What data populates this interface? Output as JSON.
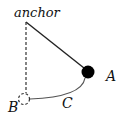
{
  "diagram": {
    "labels": {
      "anchor": "anchor",
      "a": "A",
      "b": "B",
      "c": "C"
    },
    "colors": {
      "line": "#222222",
      "ball": "#000000",
      "arc": "#555555"
    }
  }
}
